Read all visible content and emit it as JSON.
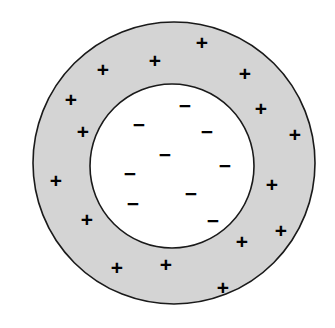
{
  "figure": {
    "canvas": {
      "width": 335,
      "height": 328,
      "background": "#ffffff"
    },
    "outer_circle": {
      "name": "outer-shell-boundary",
      "cx": 174,
      "cy": 163,
      "r": 141,
      "fill": "#d4d4d4",
      "stroke": "#1a1a1a",
      "stroke_width": 1.6
    },
    "inner_circle": {
      "name": "inner-cavity-boundary",
      "cx": 172,
      "cy": 166,
      "r": 82,
      "fill": "#ffffff",
      "stroke": "#1a1a1a",
      "stroke_width": 1.6
    },
    "symbols": {
      "positive_glyph": "+",
      "negative_glyph": "−",
      "glyph_color": "#000000",
      "positive_font_size": 21,
      "negative_font_size": 21
    },
    "positive_charges": [
      {
        "id": "plus-1",
        "x": 202,
        "y": 42,
        "label": "+"
      },
      {
        "id": "plus-2",
        "x": 155,
        "y": 60,
        "label": "+"
      },
      {
        "id": "plus-3",
        "x": 245,
        "y": 73,
        "label": "+"
      },
      {
        "id": "plus-4",
        "x": 103,
        "y": 69,
        "label": "+"
      },
      {
        "id": "plus-5",
        "x": 71,
        "y": 99,
        "label": "+"
      },
      {
        "id": "plus-6",
        "x": 261,
        "y": 108,
        "label": "+"
      },
      {
        "id": "plus-7",
        "x": 83,
        "y": 131,
        "label": "+"
      },
      {
        "id": "plus-8",
        "x": 295,
        "y": 134,
        "label": "+"
      },
      {
        "id": "plus-9",
        "x": 56,
        "y": 180,
        "label": "+"
      },
      {
        "id": "plus-10",
        "x": 272,
        "y": 184,
        "label": "+"
      },
      {
        "id": "plus-11",
        "x": 87,
        "y": 219,
        "label": "+"
      },
      {
        "id": "plus-12",
        "x": 281,
        "y": 230,
        "label": "+"
      },
      {
        "id": "plus-13",
        "x": 242,
        "y": 241,
        "label": "+"
      },
      {
        "id": "plus-14",
        "x": 117,
        "y": 267,
        "label": "+"
      },
      {
        "id": "plus-15",
        "x": 166,
        "y": 264,
        "label": "+"
      },
      {
        "id": "plus-16",
        "x": 223,
        "y": 287,
        "label": "+"
      }
    ],
    "negative_charges": [
      {
        "id": "minus-1",
        "x": 185,
        "y": 105,
        "label": "−"
      },
      {
        "id": "minus-2",
        "x": 139,
        "y": 124,
        "label": "−"
      },
      {
        "id": "minus-3",
        "x": 207,
        "y": 131,
        "label": "−"
      },
      {
        "id": "minus-4",
        "x": 165,
        "y": 154,
        "label": "−"
      },
      {
        "id": "minus-5",
        "x": 225,
        "y": 165,
        "label": "−"
      },
      {
        "id": "minus-6",
        "x": 130,
        "y": 173,
        "label": "−"
      },
      {
        "id": "minus-7",
        "x": 191,
        "y": 193,
        "label": "−"
      },
      {
        "id": "minus-8",
        "x": 133,
        "y": 203,
        "label": "−"
      },
      {
        "id": "minus-9",
        "x": 213,
        "y": 220,
        "label": "−"
      }
    ],
    "counts": {
      "positive_total": 16,
      "negative_total": 9
    }
  }
}
